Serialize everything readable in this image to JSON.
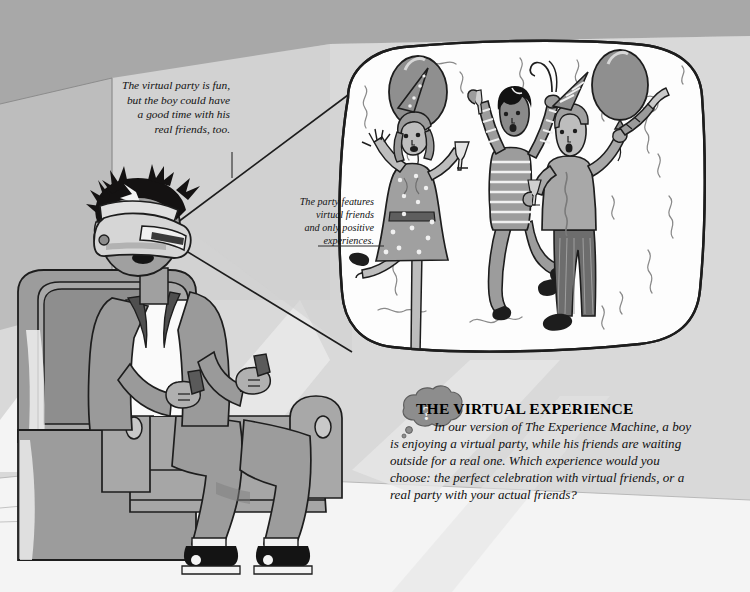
{
  "illustration": {
    "title_alt": "The Virtual Experience illustration",
    "scene_description": "A boy wearing a VR headset sits in an armchair imagining a virtual party",
    "palette": {
      "background_light": "#d9d9d9",
      "background_wall_dark": "#a9a9a9",
      "background_floor": "#f2f2f2",
      "bubble_fill": "#fdfdfd",
      "ink": "#1a1a1a",
      "mid_gray": "#9a9a9a",
      "light_gray": "#c4c4c4",
      "dark_gray": "#6d6d6d",
      "skin": "#b5b5b5",
      "hair_black": "#121212"
    }
  },
  "captions": [
    {
      "id": "caption-1",
      "text": "The virtual party is fun,\nbut the boy could have\na good time with his\nreal friends, too."
    },
    {
      "id": "caption-2",
      "text": "The party features\nvirtual friends\nand only positive\nexperiences."
    }
  ],
  "callout": {
    "icon": "thought-bubble-question-icon",
    "heading": "THE VIRTUAL EXPERIENCE",
    "body": "In our version of The Experience Machine, a boy is enjoying a virtual party, while his friends are waiting outside for a real one. Which experience would you choose: the perfect celebration with virtual friends, or a real party with your actual friends?"
  },
  "scene_elements": {
    "boy": {
      "label": "boy-with-vr-headset",
      "wearing": "VR headset",
      "holding": "two hand controllers",
      "seated_on": "armchair"
    },
    "thought_bubble": {
      "label": "thought-bubble-party-scene",
      "contents": [
        "woman-in-polka-dot-dress",
        "jumping-man-in-striped-shirt",
        "man-with-party-horn",
        "balloon-left",
        "balloon-right",
        "streamers"
      ]
    },
    "party_figures": [
      {
        "name": "woman-in-polka-dot-dress",
        "accessories": [
          "party hat",
          "champagne glass"
        ]
      },
      {
        "name": "jumping-man-in-striped-shirt",
        "accessories": [
          "noisemaker",
          "champagne glass"
        ]
      },
      {
        "name": "man-with-party-horn",
        "accessories": [
          "party hat",
          "party horn",
          "champagne glass"
        ]
      }
    ]
  }
}
